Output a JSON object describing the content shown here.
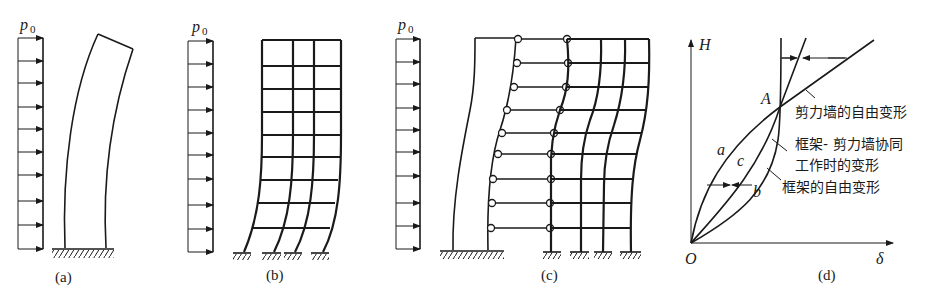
{
  "figure": {
    "panels": [
      {
        "id": "a",
        "caption": "(a)",
        "load_label": "p",
        "load_subscript": "0",
        "description": "Shear wall alone under uniform lateral load — bending-type deformation"
      },
      {
        "id": "b",
        "caption": "(b)",
        "load_label": "p",
        "load_subscript": "0",
        "description": "Frame alone under uniform lateral load — shear-type deformation"
      },
      {
        "id": "c",
        "caption": "(c)",
        "load_label": "p",
        "load_subscript": "0",
        "description": "Frame–shear wall connected by pinned links working together"
      },
      {
        "id": "d",
        "caption": "(d)",
        "description": "Height vs. deflection curves"
      }
    ],
    "graph_d": {
      "y_axis_label": "H",
      "x_axis_label": "δ",
      "origin_label": "O",
      "point_label": "A",
      "curve_labels": {
        "a": "a",
        "b": "b",
        "c": "c"
      },
      "annotations": {
        "wall_free": "剪力墙的自由变形",
        "combined_line1": "框架- 剪力墙协同",
        "combined_line2": "工作时的变形",
        "frame_free": "框架的自由变形"
      }
    }
  },
  "colors": {
    "ink": "#1a1a1a",
    "background": "#ffffff"
  }
}
